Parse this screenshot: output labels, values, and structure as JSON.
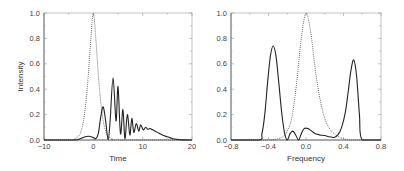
{
  "chart_data": [
    {
      "type": "line",
      "title": "",
      "xlabel": "Time",
      "ylabel": "Intensity",
      "xlim": [
        -10,
        20
      ],
      "ylim": [
        0,
        1.0
      ],
      "xticks": [
        -10,
        0,
        10,
        20
      ],
      "xtick_labels": [
        "−10",
        "0",
        "10",
        "20"
      ],
      "yticks": [
        0.0,
        0.2,
        0.4,
        0.6,
        0.8,
        1.0
      ],
      "ytick_labels": [
        "0.0",
        "0.2",
        "0.4",
        "0.6",
        "0.8",
        "1.0"
      ],
      "grid": false,
      "legend": null,
      "series": [
        {
          "name": "input pulse (dotted)",
          "style": "dotted",
          "x": [
            -10,
            -5,
            -4,
            -3,
            -2.5,
            -2,
            -1.5,
            -1,
            -0.5,
            0,
            0.5,
            1,
            1.5,
            2,
            2.5,
            3,
            4,
            5,
            20
          ],
          "y": [
            0,
            0,
            0.005,
            0.03,
            0.07,
            0.15,
            0.3,
            0.52,
            0.8,
            1.0,
            0.8,
            0.52,
            0.3,
            0.15,
            0.07,
            0.03,
            0.005,
            0,
            0
          ]
        },
        {
          "name": "output pulse (solid)",
          "style": "solid",
          "x": [
            -10,
            -4,
            -3,
            -2,
            -1,
            0,
            0.5,
            1,
            1.5,
            2,
            2.5,
            3,
            3.4,
            4,
            4.6,
            5,
            5.5,
            6,
            6.4,
            6.9,
            7.4,
            7.8,
            8.2,
            8.7,
            9.2,
            9.6,
            10.1,
            10.6,
            11,
            11.5,
            12,
            13,
            14,
            15,
            16,
            17,
            18,
            20
          ],
          "y": [
            0,
            0,
            0.005,
            0.02,
            0.03,
            0.02,
            0.01,
            0.05,
            0.18,
            0.26,
            0.15,
            0.0,
            0.15,
            0.49,
            0.15,
            0.42,
            0.05,
            0.24,
            0.01,
            0.2,
            0.04,
            0.17,
            0.06,
            0.13,
            0.07,
            0.12,
            0.08,
            0.1,
            0.085,
            0.09,
            0.08,
            0.06,
            0.04,
            0.025,
            0.012,
            0.005,
            0.001,
            0
          ]
        }
      ]
    },
    {
      "type": "line",
      "title": "",
      "xlabel": "Frequency",
      "ylabel": "",
      "xlim": [
        -0.8,
        0.8
      ],
      "ylim": [
        0,
        1.0
      ],
      "xticks": [
        -0.8,
        -0.4,
        0.0,
        0.4,
        0.8
      ],
      "xtick_labels": [
        "−0.8",
        "−0.4",
        "0.0",
        "0.4",
        "0.8"
      ],
      "yticks": [
        0.0,
        0.2,
        0.4,
        0.6,
        0.8,
        1.0
      ],
      "ytick_labels": [
        "0.0",
        "0.2",
        "0.4",
        "0.6",
        "0.8",
        "1.0"
      ],
      "grid": false,
      "legend": null,
      "series": [
        {
          "name": "input spectrum (dotted)",
          "style": "dotted",
          "x": [
            -0.8,
            -0.4,
            -0.3,
            -0.25,
            -0.2,
            -0.15,
            -0.1,
            -0.05,
            0.0,
            0.05,
            0.1,
            0.15,
            0.2,
            0.25,
            0.3,
            0.35,
            0.4,
            0.5,
            0.8
          ],
          "y": [
            0,
            0,
            0.01,
            0.025,
            0.07,
            0.18,
            0.45,
            0.8,
            1.0,
            0.85,
            0.55,
            0.32,
            0.17,
            0.09,
            0.05,
            0.025,
            0.01,
            0,
            0
          ]
        },
        {
          "name": "output spectrum (solid)",
          "style": "solid",
          "x": [
            -0.8,
            -0.5,
            -0.47,
            -0.44,
            -0.41,
            -0.38,
            -0.35,
            -0.32,
            -0.29,
            -0.26,
            -0.23,
            -0.2,
            -0.17,
            -0.14,
            -0.11,
            -0.08,
            -0.05,
            -0.02,
            0.02,
            0.06,
            0.1,
            0.15,
            0.2,
            0.25,
            0.3,
            0.34,
            0.38,
            0.42,
            0.45,
            0.48,
            0.51,
            0.54,
            0.57,
            0.6,
            0.8
          ],
          "y": [
            0,
            0,
            0.05,
            0.2,
            0.45,
            0.66,
            0.74,
            0.66,
            0.45,
            0.22,
            0.06,
            0.0,
            0.05,
            0.07,
            0.04,
            0.0,
            0.05,
            0.09,
            0.09,
            0.07,
            0.05,
            0.04,
            0.035,
            0.025,
            0.02,
            0.04,
            0.1,
            0.22,
            0.38,
            0.55,
            0.63,
            0.5,
            0.2,
            0.0,
            0
          ]
        }
      ]
    }
  ],
  "panels": [
    {
      "xlabel": "Time",
      "ylabel": "Intensity"
    },
    {
      "xlabel": "Frequency",
      "ylabel": ""
    }
  ]
}
